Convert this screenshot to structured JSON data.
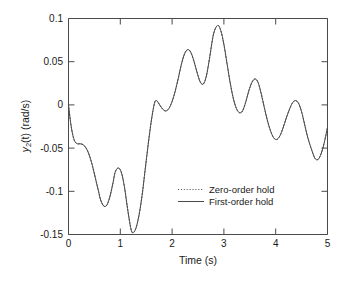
{
  "chart_data": {
    "type": "line",
    "title": "",
    "xlabel": "Time (s)",
    "ylabel": "y2(t)  (rad/s)",
    "ylabel_parts": {
      "base": "y",
      "sub": "2",
      "rest": "(t)  (rad/s)"
    },
    "xlim": [
      0,
      5
    ],
    "ylim": [
      -0.15,
      0.1
    ],
    "xticks": [
      0,
      1,
      2,
      3,
      4,
      5
    ],
    "xtick_labels": [
      "0",
      "1",
      "2",
      "3",
      "4",
      "5"
    ],
    "yticks": [
      0.1,
      0.05,
      0,
      -0.05,
      -0.1,
      -0.15
    ],
    "ytick_labels": [
      "0.1",
      "0.05",
      "0",
      "-0.05",
      "-0.1",
      "-0.15"
    ],
    "grid": false,
    "legend_position": "center-right-lower",
    "line_color": "#4a4a4a",
    "series": [
      {
        "name": "Zero-order hold",
        "style": "dotted",
        "visible_overlap": true,
        "x": [
          0.0,
          0.04,
          0.08,
          0.12,
          0.17,
          0.22,
          0.28,
          0.34,
          0.4,
          0.46,
          0.52,
          0.58,
          0.62,
          0.68,
          0.74,
          0.8,
          0.86,
          0.9,
          0.96,
          1.02,
          1.08,
          1.14,
          1.2,
          1.24,
          1.3,
          1.36,
          1.42,
          1.48,
          1.54,
          1.6,
          1.66,
          1.7,
          1.76,
          1.82,
          1.88,
          1.94,
          2.0,
          2.06,
          2.12,
          2.18,
          2.24,
          2.3,
          2.36,
          2.42,
          2.48,
          2.54,
          2.6,
          2.66,
          2.72,
          2.8,
          2.88,
          2.94,
          3.0,
          3.06,
          3.12,
          3.18,
          3.24,
          3.3,
          3.36,
          3.42,
          3.48,
          3.54,
          3.6,
          3.66,
          3.72,
          3.78,
          3.84,
          3.9,
          3.96,
          4.02,
          4.08,
          4.14,
          4.2,
          4.26,
          4.32,
          4.38,
          4.44,
          4.5,
          4.56,
          4.62,
          4.7,
          4.76,
          4.82,
          4.88,
          4.94,
          5.0
        ],
        "y": [
          0.0,
          -0.02,
          -0.034,
          -0.042,
          -0.045,
          -0.045,
          -0.046,
          -0.05,
          -0.058,
          -0.07,
          -0.085,
          -0.1,
          -0.11,
          -0.117,
          -0.116,
          -0.106,
          -0.09,
          -0.078,
          -0.073,
          -0.078,
          -0.095,
          -0.12,
          -0.142,
          -0.148,
          -0.143,
          -0.128,
          -0.105,
          -0.075,
          -0.045,
          -0.018,
          0.002,
          0.005,
          0.0,
          -0.005,
          -0.007,
          -0.004,
          0.004,
          0.016,
          0.031,
          0.047,
          0.059,
          0.064,
          0.061,
          0.051,
          0.038,
          0.027,
          0.024,
          0.033,
          0.053,
          0.082,
          0.092,
          0.086,
          0.07,
          0.048,
          0.026,
          0.008,
          -0.004,
          -0.009,
          -0.007,
          0.003,
          0.016,
          0.026,
          0.03,
          0.026,
          0.013,
          -0.003,
          -0.018,
          -0.03,
          -0.038,
          -0.04,
          -0.036,
          -0.027,
          -0.016,
          -0.006,
          0.002,
          0.005,
          0.002,
          -0.008,
          -0.023,
          -0.038,
          -0.053,
          -0.062,
          -0.063,
          -0.056,
          -0.043,
          -0.026
        ]
      },
      {
        "name": "First-order hold",
        "style": "solid",
        "x": [
          0.0,
          0.04,
          0.08,
          0.12,
          0.17,
          0.22,
          0.28,
          0.34,
          0.4,
          0.46,
          0.52,
          0.58,
          0.62,
          0.68,
          0.74,
          0.8,
          0.86,
          0.9,
          0.96,
          1.02,
          1.08,
          1.14,
          1.2,
          1.24,
          1.3,
          1.36,
          1.42,
          1.48,
          1.54,
          1.6,
          1.66,
          1.7,
          1.76,
          1.82,
          1.88,
          1.94,
          2.0,
          2.06,
          2.12,
          2.18,
          2.24,
          2.3,
          2.36,
          2.42,
          2.48,
          2.54,
          2.6,
          2.66,
          2.72,
          2.8,
          2.88,
          2.94,
          3.0,
          3.06,
          3.12,
          3.18,
          3.24,
          3.3,
          3.36,
          3.42,
          3.48,
          3.54,
          3.6,
          3.66,
          3.72,
          3.78,
          3.84,
          3.9,
          3.96,
          4.02,
          4.08,
          4.14,
          4.2,
          4.26,
          4.32,
          4.38,
          4.44,
          4.5,
          4.56,
          4.62,
          4.7,
          4.76,
          4.82,
          4.88,
          4.94,
          5.0
        ],
        "y": [
          0.0,
          -0.02,
          -0.034,
          -0.042,
          -0.045,
          -0.045,
          -0.046,
          -0.05,
          -0.058,
          -0.07,
          -0.085,
          -0.1,
          -0.11,
          -0.117,
          -0.116,
          -0.106,
          -0.09,
          -0.078,
          -0.073,
          -0.078,
          -0.095,
          -0.12,
          -0.142,
          -0.148,
          -0.143,
          -0.128,
          -0.105,
          -0.075,
          -0.045,
          -0.018,
          0.002,
          0.005,
          0.0,
          -0.005,
          -0.007,
          -0.004,
          0.004,
          0.016,
          0.031,
          0.047,
          0.059,
          0.064,
          0.061,
          0.051,
          0.038,
          0.027,
          0.024,
          0.033,
          0.053,
          0.082,
          0.092,
          0.086,
          0.07,
          0.048,
          0.026,
          0.008,
          -0.004,
          -0.009,
          -0.007,
          0.003,
          0.016,
          0.026,
          0.03,
          0.026,
          0.013,
          -0.003,
          -0.018,
          -0.03,
          -0.038,
          -0.04,
          -0.036,
          -0.027,
          -0.016,
          -0.006,
          0.002,
          0.005,
          0.002,
          -0.008,
          -0.023,
          -0.038,
          -0.053,
          -0.062,
          -0.063,
          -0.056,
          -0.043,
          -0.026
        ]
      }
    ],
    "annotations": []
  },
  "legend": {
    "entries": [
      {
        "label": "Zero-order hold",
        "style": "dotted"
      },
      {
        "label": "First-order hold",
        "style": "solid"
      }
    ]
  }
}
